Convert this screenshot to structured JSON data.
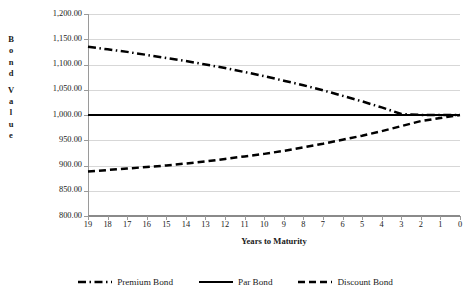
{
  "chart_data": {
    "type": "line",
    "title": "Bond Value Over Time",
    "xlabel": "Years to Maturity",
    "ylabel": "Bond Value",
    "ylabel_letters": [
      "B",
      "o",
      "n",
      "d",
      "",
      "V",
      "a",
      "l",
      "u",
      "e"
    ],
    "grid": true,
    "legend_position": "bottom",
    "xlim": [
      19,
      0
    ],
    "ylim": [
      800,
      1200
    ],
    "x_tick_labels": [
      "19",
      "18",
      "17",
      "16",
      "15",
      "14",
      "13",
      "12",
      "11",
      "10",
      "9",
      "8",
      "7",
      "6",
      "5",
      "4",
      "3",
      "2",
      "1",
      "0"
    ],
    "y_tick_labels": [
      "1,200.00",
      "1,150.00",
      "1,100.00",
      "1,050.00",
      "1,000.00",
      "950.00",
      "900.00",
      "850.00",
      "800.00"
    ],
    "y_tick_values": [
      1200,
      1150,
      1100,
      1050,
      1000,
      950,
      900,
      850,
      800
    ],
    "x": [
      19,
      18,
      17,
      16,
      15,
      14,
      13,
      12,
      11,
      10,
      9,
      8,
      7,
      6,
      5,
      4,
      3,
      2,
      1,
      0
    ],
    "series": [
      {
        "name": "Premium Bond",
        "style": "dash-dot",
        "color": "#000000",
        "values": [
          1135,
          1130,
          1125,
          1119,
          1113,
          1107,
          1100,
          1093,
          1085,
          1077,
          1068,
          1059,
          1049,
          1038,
          1027,
          1015,
          1002,
          1000,
          1000,
          1000
        ]
      },
      {
        "name": "Par Bond",
        "style": "solid",
        "color": "#000000",
        "values": [
          1000,
          1000,
          1000,
          1000,
          1000,
          1000,
          1000,
          1000,
          1000,
          1000,
          1000,
          1000,
          1000,
          1000,
          1000,
          1000,
          1000,
          1000,
          1000,
          1000
        ]
      },
      {
        "name": "Discount Bond",
        "style": "dashed",
        "color": "#000000",
        "values": [
          888,
          891,
          894,
          897,
          900,
          904,
          908,
          913,
          918,
          923,
          929,
          936,
          943,
          951,
          959,
          968,
          978,
          988,
          994,
          1000
        ]
      }
    ]
  },
  "legend": {
    "items": [
      {
        "label": "Premium Bond",
        "style": "dash-dot"
      },
      {
        "label": "Par Bond",
        "style": "solid"
      },
      {
        "label": "Discount Bond",
        "style": "dashed"
      }
    ]
  }
}
